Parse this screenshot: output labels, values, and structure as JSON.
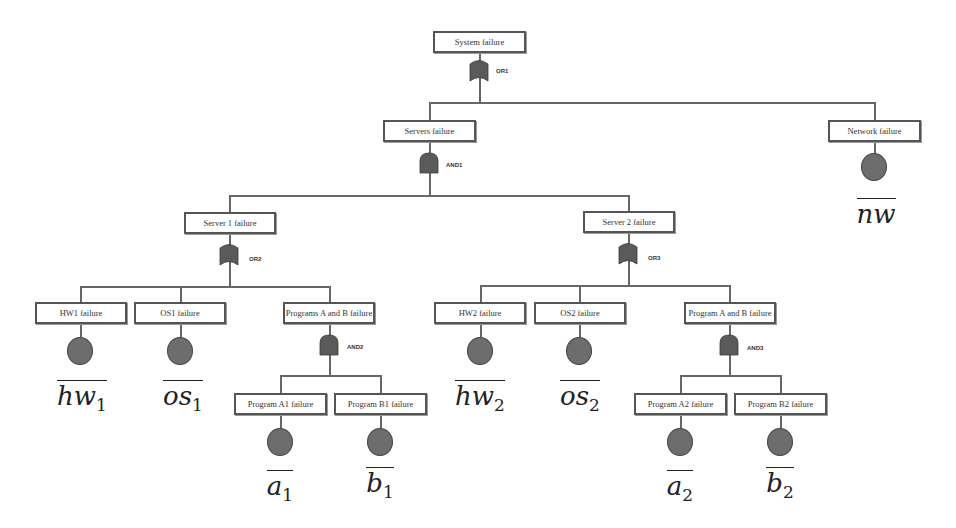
{
  "diagram": {
    "type": "fault-tree",
    "colors": {
      "line": "#666666",
      "box_border": "#555555",
      "gate_fill": "#5a5a5a",
      "event_fill": "#6d6d6d"
    },
    "top_event": {
      "label": "System failure",
      "gate": {
        "type": "OR",
        "id": "OR1"
      }
    },
    "servers": {
      "label": "Servers failure",
      "gate": {
        "type": "AND",
        "id": "AND1"
      }
    },
    "network": {
      "label": "Network failure",
      "symbol": "nw",
      "subscript": ""
    },
    "server1": {
      "label": "Server 1 failure",
      "gate": {
        "type": "OR",
        "id": "OR2"
      },
      "hw": {
        "label": "HW1 failure",
        "symbol": "hw",
        "subscript": "1"
      },
      "os": {
        "label": "OS1 failure",
        "symbol": "os",
        "subscript": "1"
      },
      "programs": {
        "label": "Programs A and B failure",
        "gate": {
          "type": "AND",
          "id": "AND2"
        },
        "a": {
          "label": "Program A1 failure",
          "symbol": "a",
          "subscript": "1"
        },
        "b": {
          "label": "Program B1 failure",
          "symbol": "b",
          "subscript": "1"
        }
      }
    },
    "server2": {
      "label": "Server 2 failure",
      "gate": {
        "type": "OR",
        "id": "OR3"
      },
      "hw": {
        "label": "HW2 failure",
        "symbol": "hw",
        "subscript": "2"
      },
      "os": {
        "label": "OS2 failure",
        "symbol": "os",
        "subscript": "2"
      },
      "programs": {
        "label": "Program A and B failure",
        "gate": {
          "type": "AND",
          "id": "AND3"
        },
        "a": {
          "label": "Program A2 failure",
          "symbol": "a",
          "subscript": "2"
        },
        "b": {
          "label": "Program B2 failure",
          "symbol": "b",
          "subscript": "2"
        }
      }
    }
  }
}
